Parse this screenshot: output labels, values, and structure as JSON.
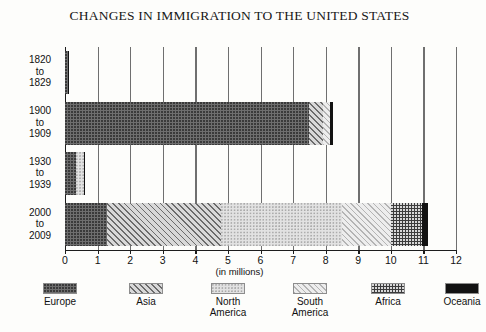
{
  "chart_data": {
    "type": "bar",
    "orientation": "horizontal",
    "stacked": true,
    "title": "CHANGES IN IMMIGRATION TO THE UNITED STATES",
    "xlabel": "(in millions)",
    "ylabel": "",
    "xlim": [
      0,
      12
    ],
    "xticks": [
      0,
      1,
      2,
      3,
      4,
      5,
      6,
      7,
      8,
      9,
      10,
      11,
      12
    ],
    "xticklabels": [
      "0",
      "1",
      "2",
      "3",
      "4",
      "5",
      "6",
      "7",
      "8",
      "9",
      "10",
      "11",
      "12"
    ],
    "grid": true,
    "grid_axis": "x",
    "legend_position": "bottom",
    "categories": [
      "1820 to 1829",
      "1900 to 1909",
      "1930 to 1939",
      "2000 to 2009"
    ],
    "category_lines": [
      [
        "1820",
        "to",
        "1829"
      ],
      [
        "1900",
        "to",
        "1909"
      ],
      [
        "1930",
        "to",
        "1939"
      ],
      [
        "2000",
        "to",
        "2009"
      ]
    ],
    "series": [
      {
        "name": "Europe",
        "pattern": "dark-dotted",
        "values": [
          0.1,
          7.5,
          0.35,
          1.3
        ]
      },
      {
        "name": "Asia",
        "pattern": "diagonal-hatch",
        "values": [
          0.0,
          0.42,
          0.0,
          3.5
        ]
      },
      {
        "name": "North America",
        "pattern": "light-dotted",
        "values": [
          0.0,
          0.0,
          0.22,
          3.7
        ]
      },
      {
        "name": "South America",
        "pattern": "light-diagonal",
        "values": [
          0.0,
          0.22,
          0.0,
          1.5
        ]
      },
      {
        "name": "Africa",
        "pattern": "dark-dotted-dense",
        "values": [
          0.0,
          0.0,
          0.0,
          0.95
        ]
      },
      {
        "name": "Oceania",
        "pattern": "solid-black",
        "values": [
          0.03,
          0.08,
          0.04,
          0.2
        ]
      }
    ],
    "totals": [
      0.13,
      8.22,
      0.61,
      11.15
    ]
  },
  "legend": {
    "items": [
      {
        "label": "Europe",
        "lines": [
          "Europe"
        ]
      },
      {
        "label": "Asia",
        "lines": [
          "Asia"
        ]
      },
      {
        "label": "North America",
        "lines": [
          "North",
          "America"
        ]
      },
      {
        "label": "South America",
        "lines": [
          "South",
          "America"
        ]
      },
      {
        "label": "Africa",
        "lines": [
          "Africa"
        ]
      },
      {
        "label": "Oceania",
        "lines": [
          "Oceania"
        ]
      }
    ]
  },
  "colors": {
    "europe": "#6e6e6e",
    "asia": "#d8d8d8",
    "north_america": "#e2e2e2",
    "south_america": "#ededed",
    "africa": "#3c3c3c",
    "oceania": "#121212",
    "axis": "#1d1d1d",
    "grid": "#6f6f6f",
    "background": "#fdfdfb"
  }
}
